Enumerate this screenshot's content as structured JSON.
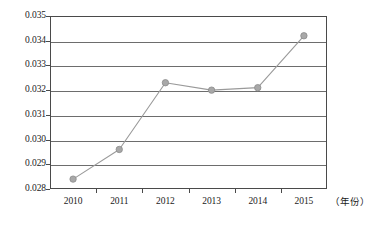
{
  "chart_data": {
    "type": "line",
    "title": "",
    "xlabel": "（年份）",
    "ylabel": "",
    "categories": [
      "2010",
      "2011",
      "2012",
      "2013",
      "2014",
      "2015"
    ],
    "values": [
      0.0284,
      0.0296,
      0.0323,
      0.032,
      0.0321,
      0.0342
    ],
    "series": [
      {
        "name": "series-1",
        "values": [
          0.0284,
          0.0296,
          0.0323,
          0.032,
          0.0321,
          0.0342
        ]
      }
    ],
    "ylim": [
      0.028,
      0.035
    ],
    "ytick_labels": [
      "0.035",
      "0.034",
      "0.033",
      "0.032",
      "0.031",
      "0.030",
      "0.029",
      "0.028"
    ],
    "ytick_values": [
      0.035,
      0.034,
      0.033,
      0.032,
      0.031,
      0.03,
      0.029,
      0.028
    ],
    "grid": true,
    "legend": "none",
    "marker": "circle",
    "colors": {
      "line": "#9a9a9a",
      "marker_fill": "#a8a8a8",
      "marker_stroke": "#8c8c8c",
      "gridline": "#6d6d6d",
      "frame": "#4a4a4a",
      "text": "#1b1b1b",
      "background": "#ffffff"
    }
  },
  "axes": {
    "x_unit_label": "（年份）"
  }
}
